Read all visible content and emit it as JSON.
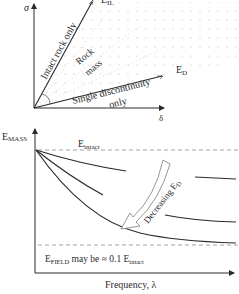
{
  "top_diagram": {
    "y_axis_label": "σ",
    "x_axis_label": "δ",
    "top_line_label": "E",
    "top_line_label_sub": "IL",
    "bottom_line_label": "E",
    "bottom_line_label_sub": "D",
    "upper_region_label": "Intact rock only",
    "middle_region_label_line1": "Rock",
    "middle_region_label_line2": "mass",
    "lower_region_label_line1": "Single discontinuity",
    "lower_region_label_line2": "only"
  },
  "bottom_chart": {
    "y_axis_label": "E",
    "y_axis_label_sub": "MASS",
    "x_axis_label": "Frequency, λ",
    "upper_dashed_label": "E",
    "upper_dashed_label_sub": "intact",
    "arrow_label": "Decreasing E",
    "arrow_label_sub": "D",
    "note_prefix": "E",
    "note_prefix_sub": "FIELD",
    "note_middle": " may be ≈ 0.1 E",
    "note_suffix_sub": "intact"
  },
  "colors": {
    "line": "#2a2a2a",
    "dashed": "#8a8a8a",
    "dots": "#b5b5b5"
  }
}
